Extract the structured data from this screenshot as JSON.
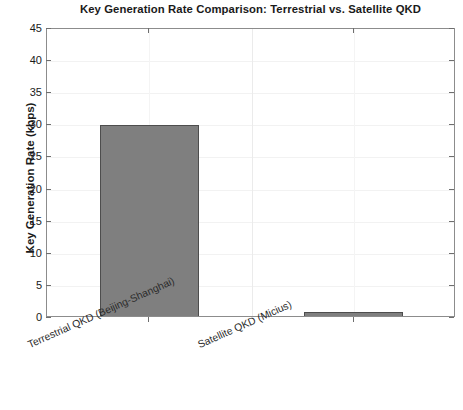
{
  "chart_data": {
    "type": "bar",
    "title": "Key Generation Rate Comparison: Terrestrial vs. Satellite QKD",
    "xlabel": "",
    "ylabel": "Key Generation Rate (kbps)",
    "categories": [
      "Terrestrial QKD (Beijing-Shanghai)",
      "Satellite QKD (Micius)"
    ],
    "values": [
      30,
      1
    ],
    "ylim": [
      0,
      45
    ],
    "ytick_values": [
      0,
      5,
      10,
      15,
      20,
      25,
      30,
      35,
      40,
      45
    ],
    "ytick_labels": [
      "0",
      "5",
      "10",
      "15",
      "20",
      "25",
      "30",
      "35",
      "40",
      "45"
    ],
    "grid": true,
    "legend": null,
    "bar_color": "#7f7f7f",
    "bar_edge_color": "#4d4d4d",
    "axes_color": "#8c8c8c",
    "grid_color": "#ebebeb",
    "text_color": "#1a1a1a"
  },
  "notes": {
    "clipped_top_labels": [
      "45",
      "40",
      "35"
    ]
  }
}
